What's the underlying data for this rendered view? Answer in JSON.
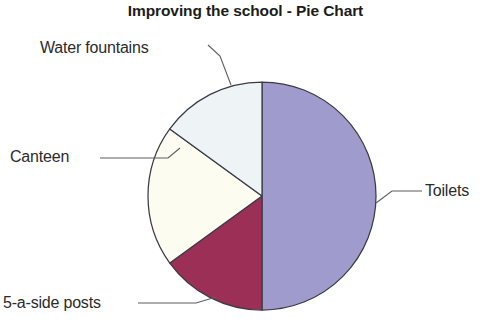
{
  "chart_data": {
    "type": "pie",
    "title": "Improving the school - Pie Chart",
    "xlabel": "",
    "ylabel": "",
    "legend": "none",
    "grid": false,
    "categories": [
      "Toilets",
      "5-a-side posts",
      "Canteen",
      "Water fountains"
    ],
    "values": [
      50,
      15,
      20,
      15
    ],
    "units": "percent",
    "labels_placement": "callout-leader-lines",
    "start_angle_deg": 0,
    "direction": "clockwise",
    "slices": [
      {
        "name": "Toilets",
        "label": "Toilets",
        "value": 50,
        "color": "#9f9bcc",
        "start_deg": 0,
        "end_deg": 180
      },
      {
        "name": "5-a-side posts",
        "label": "5-a-side posts",
        "value": 15,
        "color": "#9c2f56",
        "start_deg": 180,
        "end_deg": 234
      },
      {
        "name": "Canteen",
        "label": "Canteen",
        "value": 20,
        "color": "#fdfcf0",
        "start_deg": 234,
        "end_deg": 306
      },
      {
        "name": "Water fountains",
        "label": "Water fountains",
        "value": 15,
        "color": "#eef4f6",
        "start_deg": 306,
        "end_deg": 360
      }
    ]
  },
  "figure": {
    "title": "Improving the school - Pie Chart",
    "background_color": "#ffffff",
    "outline_color": "#3b3b47",
    "leader_line_color": "#5d5d63"
  },
  "labels": {
    "water_fountains": "Water fountains",
    "canteen": "Canteen",
    "five_a_side_posts": "5-a-side posts",
    "toilets": "Toilets"
  }
}
